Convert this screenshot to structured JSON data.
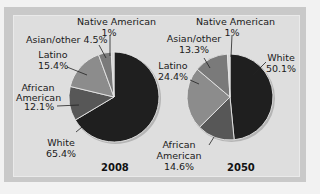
{
  "chart_data": [
    {
      "type": "pie",
      "title": "2008",
      "categories": [
        "White",
        "African American",
        "Latino",
        "Asian/other",
        "Native American"
      ],
      "values": [
        65.4,
        12.1,
        15.4,
        4.5,
        1
      ],
      "colors": [
        "#1f1f1f",
        "#575757",
        "#8c8c8c",
        "#7a7a7a",
        "#d4d4d4"
      ]
    },
    {
      "type": "pie",
      "title": "2050",
      "categories": [
        "White",
        "African American",
        "Latino",
        "Asian/other",
        "Native American"
      ],
      "values": [
        50.1,
        14.6,
        24.4,
        13.3,
        1
      ],
      "colors": [
        "#1f1f1f",
        "#575757",
        "#8c8c8c",
        "#7a7a7a",
        "#d4d4d4"
      ]
    }
  ],
  "labels2008": {
    "native_name": "Native American",
    "native_val": "1%",
    "asian": "Asian/other 4.5%",
    "latino_name": "Latino",
    "latino_val": "15.4%",
    "african_name1": "African",
    "african_name2": "American",
    "african_val": "12.1%",
    "white_name": "White",
    "white_val": "65.4%",
    "year": "2008"
  },
  "labels2050": {
    "native_name": "Native American",
    "native_val": "1%",
    "asian_name": "Asian/other",
    "asian_val": "13.3%",
    "latino_name": "Latino",
    "latino_val": "24.4%",
    "white_name": "White",
    "white_val": "50.1%",
    "african_name1": "African",
    "african_name2": "American",
    "african_val": "14.6%",
    "year": "2050"
  }
}
